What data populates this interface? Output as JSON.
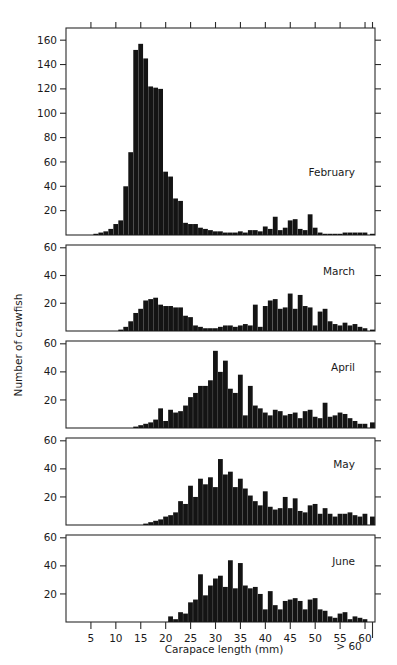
{
  "chart_data": {
    "type": "bar",
    "title": "",
    "subtitle": "",
    "xlabel": "Carapace length (mm)",
    "ylabel": "Number of crawfish",
    "grid": false,
    "legend_position": "inside-right",
    "bin_width": 1,
    "xlim": [
      0,
      62
    ],
    "x_tick_labels": [
      "5",
      "10",
      "15",
      "20",
      "25",
      "30",
      "35",
      "40",
      "45",
      "50",
      "55",
      "60"
    ],
    "x_tick_values": [
      5,
      10,
      15,
      20,
      25,
      30,
      35,
      40,
      45,
      50,
      55,
      60
    ],
    "overflow_label": "> 60",
    "overflow_bin_x": 61.5,
    "panels": [
      {
        "name": "February",
        "label": "February",
        "ylim": [
          0,
          170
        ],
        "y_tick_labels": [
          "20",
          "40",
          "60",
          "80",
          "100",
          "120",
          "140",
          "160"
        ],
        "y_tick_values": [
          20,
          40,
          60,
          80,
          100,
          120,
          140,
          160
        ],
        "bins": [
          1,
          2,
          3,
          4,
          5,
          6,
          7,
          8,
          9,
          10,
          11,
          12,
          13,
          14,
          15,
          16,
          17,
          18,
          19,
          20,
          21,
          22,
          23,
          24,
          25,
          26,
          27,
          28,
          29,
          30,
          31,
          32,
          33,
          34,
          35,
          36,
          37,
          38,
          39,
          40,
          41,
          42,
          43,
          44,
          45,
          46,
          47,
          48,
          49,
          50,
          51,
          52,
          53,
          54,
          55,
          56,
          57,
          58,
          59,
          60,
          61.5
        ],
        "values": [
          0,
          0,
          0,
          0,
          0,
          1,
          2,
          3,
          5,
          9,
          12,
          40,
          68,
          152,
          157,
          145,
          122,
          121,
          120,
          52,
          48,
          30,
          28,
          10,
          9,
          9,
          6,
          5,
          4,
          3,
          3,
          2,
          2,
          2,
          3,
          2,
          4,
          4,
          3,
          7,
          5,
          15,
          4,
          6,
          12,
          13,
          5,
          4,
          17,
          6,
          2,
          1,
          1,
          1,
          1,
          2,
          2,
          2,
          2,
          2,
          1
        ]
      },
      {
        "name": "March",
        "label": "March",
        "ylim": [
          0,
          62
        ],
        "y_tick_labels": [
          "20",
          "40",
          "60"
        ],
        "y_tick_values": [
          20,
          40,
          60
        ],
        "bins": [
          1,
          2,
          3,
          4,
          5,
          6,
          7,
          8,
          9,
          10,
          11,
          12,
          13,
          14,
          15,
          16,
          17,
          18,
          19,
          20,
          21,
          22,
          23,
          24,
          25,
          26,
          27,
          28,
          29,
          30,
          31,
          32,
          33,
          34,
          35,
          36,
          37,
          38,
          39,
          40,
          41,
          42,
          43,
          44,
          45,
          46,
          47,
          48,
          49,
          50,
          51,
          52,
          53,
          54,
          55,
          56,
          57,
          58,
          59,
          60,
          61.5
        ],
        "values": [
          0,
          0,
          0,
          0,
          0,
          0,
          0,
          0,
          0,
          0,
          1,
          3,
          7,
          13,
          16,
          22,
          23,
          24,
          19,
          18,
          18,
          17,
          17,
          11,
          10,
          4,
          3,
          2,
          2,
          2,
          3,
          4,
          4,
          3,
          4,
          5,
          4,
          19,
          3,
          18,
          22,
          23,
          16,
          17,
          27,
          16,
          26,
          18,
          17,
          4,
          14,
          16,
          7,
          5,
          4,
          6,
          4,
          5,
          3,
          2,
          1
        ]
      },
      {
        "name": "April",
        "label": "April",
        "ylim": [
          0,
          62
        ],
        "y_tick_labels": [
          "20",
          "40",
          "60"
        ],
        "y_tick_values": [
          20,
          40,
          60
        ],
        "bins": [
          1,
          2,
          3,
          4,
          5,
          6,
          7,
          8,
          9,
          10,
          11,
          12,
          13,
          14,
          15,
          16,
          17,
          18,
          19,
          20,
          21,
          22,
          23,
          24,
          25,
          26,
          27,
          28,
          29,
          30,
          31,
          32,
          33,
          34,
          35,
          36,
          37,
          38,
          39,
          40,
          41,
          42,
          43,
          44,
          45,
          46,
          47,
          48,
          49,
          50,
          51,
          52,
          53,
          54,
          55,
          56,
          57,
          58,
          59,
          60,
          61.5
        ],
        "values": [
          0,
          0,
          0,
          0,
          0,
          0,
          0,
          0,
          0,
          0,
          0,
          0,
          0,
          1,
          2,
          3,
          4,
          6,
          14,
          5,
          13,
          11,
          12,
          16,
          22,
          25,
          30,
          30,
          34,
          55,
          40,
          48,
          28,
          25,
          38,
          9,
          30,
          16,
          14,
          11,
          9,
          13,
          12,
          9,
          10,
          11,
          7,
          12,
          13,
          8,
          7,
          18,
          8,
          9,
          11,
          10,
          7,
          5,
          3,
          3,
          4
        ]
      },
      {
        "name": "May",
        "label": "May",
        "ylim": [
          0,
          62
        ],
        "y_tick_labels": [
          "20",
          "40",
          "60"
        ],
        "y_tick_values": [
          20,
          40,
          60
        ],
        "bins": [
          1,
          2,
          3,
          4,
          5,
          6,
          7,
          8,
          9,
          10,
          11,
          12,
          13,
          14,
          15,
          16,
          17,
          18,
          19,
          20,
          21,
          22,
          23,
          24,
          25,
          26,
          27,
          28,
          29,
          30,
          31,
          32,
          33,
          34,
          35,
          36,
          37,
          38,
          39,
          40,
          41,
          42,
          43,
          44,
          45,
          46,
          47,
          48,
          49,
          50,
          51,
          52,
          53,
          54,
          55,
          56,
          57,
          58,
          59,
          60,
          61.5
        ],
        "values": [
          0,
          0,
          0,
          0,
          0,
          0,
          0,
          0,
          0,
          0,
          0,
          0,
          0,
          0,
          0,
          1,
          2,
          3,
          4,
          6,
          7,
          9,
          17,
          15,
          28,
          20,
          33,
          29,
          34,
          27,
          47,
          36,
          38,
          27,
          33,
          26,
          21,
          17,
          14,
          24,
          13,
          11,
          12,
          20,
          12,
          19,
          10,
          9,
          14,
          15,
          8,
          12,
          8,
          6,
          8,
          8,
          9,
          7,
          6,
          8,
          6
        ]
      },
      {
        "name": "June",
        "label": "June",
        "ylim": [
          0,
          62
        ],
        "y_tick_labels": [
          "20",
          "40",
          "60"
        ],
        "y_tick_values": [
          20,
          40,
          60
        ],
        "bins": [
          1,
          2,
          3,
          4,
          5,
          6,
          7,
          8,
          9,
          10,
          11,
          12,
          13,
          14,
          15,
          16,
          17,
          18,
          19,
          20,
          21,
          22,
          23,
          24,
          25,
          26,
          27,
          28,
          29,
          30,
          31,
          32,
          33,
          34,
          35,
          36,
          37,
          38,
          39,
          40,
          41,
          42,
          43,
          44,
          45,
          46,
          47,
          48,
          49,
          50,
          51,
          52,
          53,
          54,
          55,
          56,
          57,
          58,
          59,
          60,
          61.5
        ],
        "values": [
          0,
          0,
          0,
          0,
          0,
          0,
          0,
          0,
          0,
          0,
          0,
          0,
          0,
          0,
          0,
          0,
          0,
          0,
          0,
          0,
          4,
          2,
          7,
          6,
          14,
          16,
          34,
          19,
          26,
          31,
          33,
          25,
          44,
          24,
          42,
          26,
          24,
          25,
          20,
          9,
          22,
          12,
          9,
          15,
          16,
          17,
          15,
          9,
          16,
          17,
          9,
          8,
          4,
          3,
          6,
          7,
          2,
          4,
          3,
          2,
          0
        ]
      }
    ]
  },
  "axis": {
    "x_title": "Carapace length (mm)",
    "y_title": "Number of crawfish",
    "overflow_note": "> 60"
  }
}
